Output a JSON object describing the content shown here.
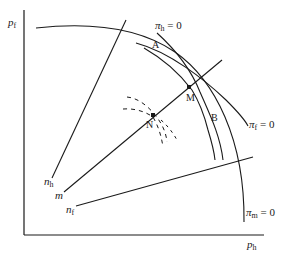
{
  "axes": {
    "y_label": {
      "main": "p",
      "sub": "f"
    },
    "x_label": {
      "main": "p",
      "sub": "h"
    }
  },
  "curves": {
    "pi_h": {
      "main": "π",
      "sub": "h",
      "eq": " = 0"
    },
    "pi_f": {
      "main": "π",
      "sub": "f",
      "eq": " = 0"
    },
    "pi_m": {
      "main": "π",
      "sub": "m",
      "eq": " = 0"
    }
  },
  "lines": {
    "n_h": {
      "main": "n",
      "sub": "h"
    },
    "m": {
      "main": "m",
      "sub": ""
    },
    "n_f": {
      "main": "n",
      "sub": "f"
    }
  },
  "points": {
    "A": "A",
    "B": "B",
    "M": "M",
    "N": "N"
  },
  "colors": {
    "stroke": "#1a1a1a",
    "background": "#ffffff"
  }
}
